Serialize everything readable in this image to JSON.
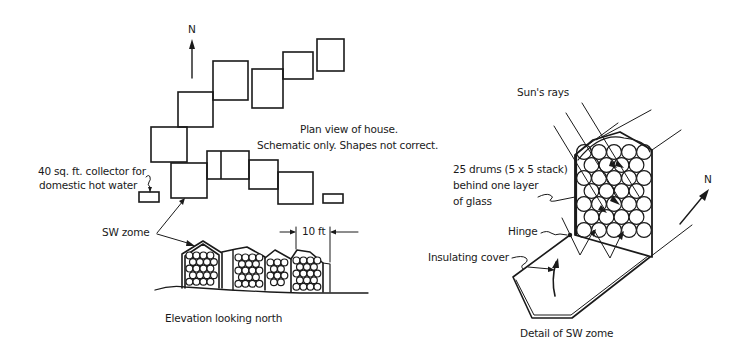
{
  "plan_view": {
    "north_label": "N",
    "title_line1": "Plan view of house.",
    "title_line2": "Schematic only. Shapes not correct.",
    "collector_label_line1": "40 sq. ft. collector for",
    "collector_label_line2": "domestic hot water",
    "zomes": [
      {
        "x": 151,
        "y": 127,
        "w": 36,
        "h": 35
      },
      {
        "x": 178,
        "y": 92,
        "w": 35,
        "h": 35
      },
      {
        "x": 213,
        "y": 61,
        "w": 35,
        "h": 39
      },
      {
        "x": 252,
        "y": 69,
        "w": 31,
        "h": 39
      },
      {
        "x": 283,
        "y": 52,
        "w": 30,
        "h": 27
      },
      {
        "x": 317,
        "y": 39,
        "w": 27,
        "h": 32
      },
      {
        "x": 171,
        "y": 163,
        "w": 36,
        "h": 35
      },
      {
        "x": 207,
        "y": 151,
        "w": 42,
        "h": 28
      },
      {
        "x": 249,
        "y": 160,
        "w": 29,
        "h": 29
      },
      {
        "x": 278,
        "y": 172,
        "w": 35,
        "h": 32
      }
    ],
    "small_rects": [
      {
        "x": 139,
        "y": 192,
        "w": 20,
        "h": 10
      },
      {
        "x": 323,
        "y": 194,
        "w": 20,
        "h": 9
      }
    ]
  },
  "elevation": {
    "sw_zome_label": "SW zome",
    "dimension_label": "10 ft",
    "caption": "Elevation looking north",
    "zome_count": 4
  },
  "detail": {
    "sun_label": "Sun's rays",
    "drums_line1": "25 drums (5 x 5 stack)",
    "drums_line2": "behind one layer",
    "drums_line3": "of glass",
    "hinge_label": "Hinge",
    "cover_label": "Insulating cover",
    "north_label": "N",
    "caption": "Detail of SW  zome",
    "drum_grid": "5 x 5"
  },
  "colors": {
    "ink": "#1a1a1a",
    "paper": "#ffffff"
  }
}
